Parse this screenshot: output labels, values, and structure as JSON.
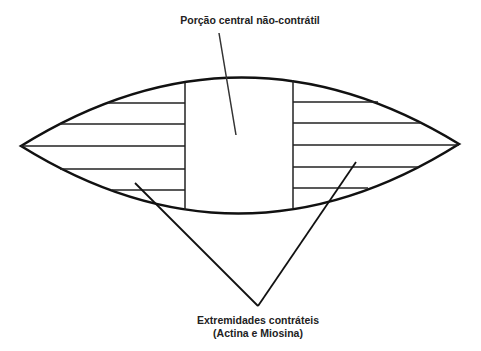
{
  "labels": {
    "top": "Porção central não-contrátil",
    "bottom_line1": "Extremidades contráteis",
    "bottom_line2": "(Actina e Miosina)"
  },
  "colors": {
    "stroke": "#111111",
    "text": "#222222",
    "background": "#ffffff"
  }
}
